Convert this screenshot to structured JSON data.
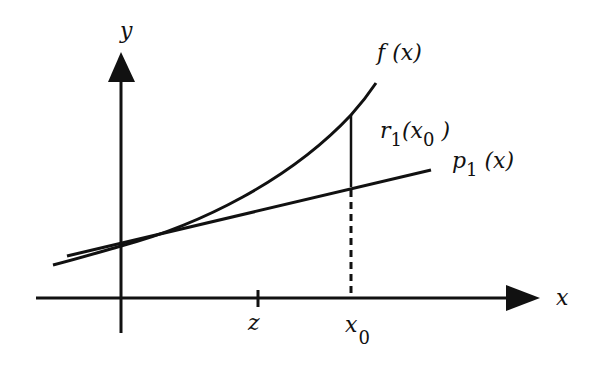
{
  "diagram": {
    "type": "taylor-linear-approximation-remainder",
    "axes": {
      "x_label": "x",
      "y_label": "y"
    },
    "ticks": [
      {
        "label": "z"
      },
      {
        "label": "x",
        "subscript": "0"
      }
    ],
    "curves": [
      {
        "name": "f",
        "label": "f (x)",
        "kind": "convex curve"
      },
      {
        "name": "p1",
        "label_main": "p",
        "label_sub": "1",
        "label_tail": " (x)",
        "kind": "tangent line"
      }
    ],
    "remainder": {
      "label_main": "r",
      "label_sub": "1",
      "label_arg_open": "(x",
      "label_arg_sub": "0",
      "label_arg_close": " )"
    },
    "colors": {
      "ink": "#111111",
      "background": "#ffffff"
    }
  }
}
